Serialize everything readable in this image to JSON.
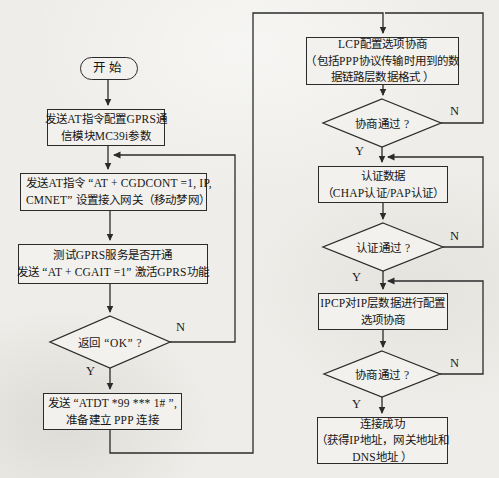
{
  "diagram": {
    "background_color": "#eeede9",
    "line_color": "#2b2b2b"
  },
  "labels": {
    "yes": "Y",
    "no": "N"
  },
  "nodes": {
    "start": {
      "label": "开始"
    },
    "config_module": {
      "line1": "发送AT指令配置GPRS通",
      "line2": "信模块MC39i参数"
    },
    "set_gateway": {
      "line1": "发送AT指令 “AT + CGDCONT =1, IP,",
      "line2": "CMNET” 设置接入网关（移动梦网）"
    },
    "test_gprs": {
      "line1": "测试GPRS服务是否开通",
      "line2": "发送 “AT + CGAIT =1” 激活GPRS功能"
    },
    "return_ok": {
      "label": "返回 “OK” ?"
    },
    "dial_ppp": {
      "line1": "发送 “ATDT *99 *** 1# ”,",
      "line2": "准备建立 PPP 连接"
    },
    "lcp_negotiate": {
      "line1": "LCP配置选项协商",
      "line2": "（包括PPP协议传输时用到的数",
      "line3": "据链路层数据格式 ）"
    },
    "lcp_pass": {
      "label": "协商通过 ?"
    },
    "auth_data": {
      "line1": "认证数据",
      "line2": "（CHAP认证/PAP认证）"
    },
    "auth_pass": {
      "label": "认证通过 ?"
    },
    "ipcp_config": {
      "line1": "IPCP对IP层数据进行配置",
      "line2": "选项协商"
    },
    "ipcp_pass": {
      "label": "协商通过 ?"
    },
    "connect_success": {
      "line1": "连接成功",
      "line2": "（获得IP地址，网关地址和",
      "line3": "DNS地址 ）"
    }
  }
}
